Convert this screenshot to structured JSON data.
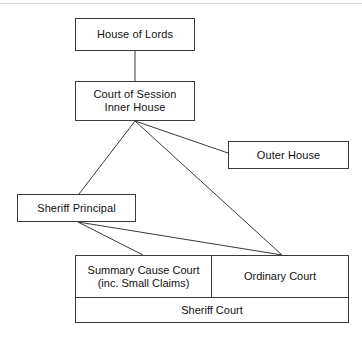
{
  "diagram": {
    "background_color": "#ffffff",
    "line_color": "#3a3a3a",
    "text_color": "#111111",
    "nodes": {
      "house_of_lords": {
        "label": "House of Lords"
      },
      "court_of_session": {
        "line1": "Court of Session",
        "line2": "Inner House"
      },
      "outer_house": {
        "label": "Outer House"
      },
      "sheriff_principal": {
        "label": "Sheriff Principal"
      },
      "summary_cause_court": {
        "line1": "Summary Cause Court",
        "line2": "(inc. Small Claims)"
      },
      "ordinary_court": {
        "label": "Ordinary Court"
      },
      "sheriff_court": {
        "label": "Sheriff Court"
      }
    },
    "edges": [
      {
        "from": "house_of_lords",
        "to": "court_of_session"
      },
      {
        "from": "court_of_session",
        "to": "outer_house"
      },
      {
        "from": "court_of_session",
        "to": "sheriff_principal"
      },
      {
        "from": "court_of_session",
        "to": "ordinary_court"
      },
      {
        "from": "sheriff_principal",
        "to": "summary_cause_court"
      },
      {
        "from": "sheriff_principal",
        "to": "ordinary_court"
      }
    ]
  }
}
